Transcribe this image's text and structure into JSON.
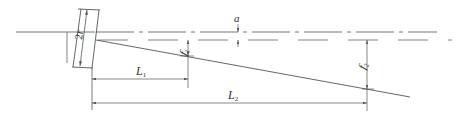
{
  "diagram": {
    "type": "engineering-schematic",
    "colors": {
      "line": "#555555",
      "text": "#333333",
      "background": "#ffffff"
    },
    "labels": {
      "two_r": {
        "main": "2",
        "var": "r"
      },
      "a": "a",
      "f1": {
        "main": "f",
        "sub": "1"
      },
      "f2": {
        "main": "f",
        "sub": "2"
      },
      "L1": {
        "main": "L",
        "sub": "1"
      },
      "L2": {
        "main": "L",
        "sub": "2"
      }
    }
  }
}
